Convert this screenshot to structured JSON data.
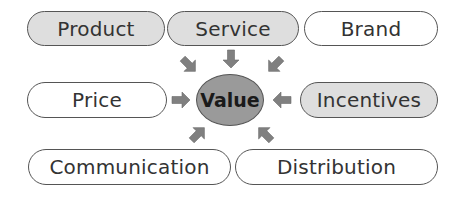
{
  "diagram": {
    "center": {
      "label": "Value",
      "fill": "#9a9a9a"
    },
    "nodes": [
      {
        "id": "product",
        "label": "Product",
        "filled": true
      },
      {
        "id": "service",
        "label": "Service",
        "filled": true
      },
      {
        "id": "brand",
        "label": "Brand",
        "filled": false
      },
      {
        "id": "price",
        "label": "Price",
        "filled": false
      },
      {
        "id": "incentives",
        "label": "Incentives",
        "filled": true
      },
      {
        "id": "communication",
        "label": "Communication",
        "filled": false
      },
      {
        "id": "distribution",
        "label": "Distribution",
        "filled": false
      }
    ],
    "arrow_color": "#808080",
    "node_fill_color": "#dedede",
    "edges": [
      "product -> value",
      "service -> value",
      "brand -> value",
      "price -> value",
      "incentives -> value",
      "communication -> value",
      "distribution -> value"
    ]
  }
}
